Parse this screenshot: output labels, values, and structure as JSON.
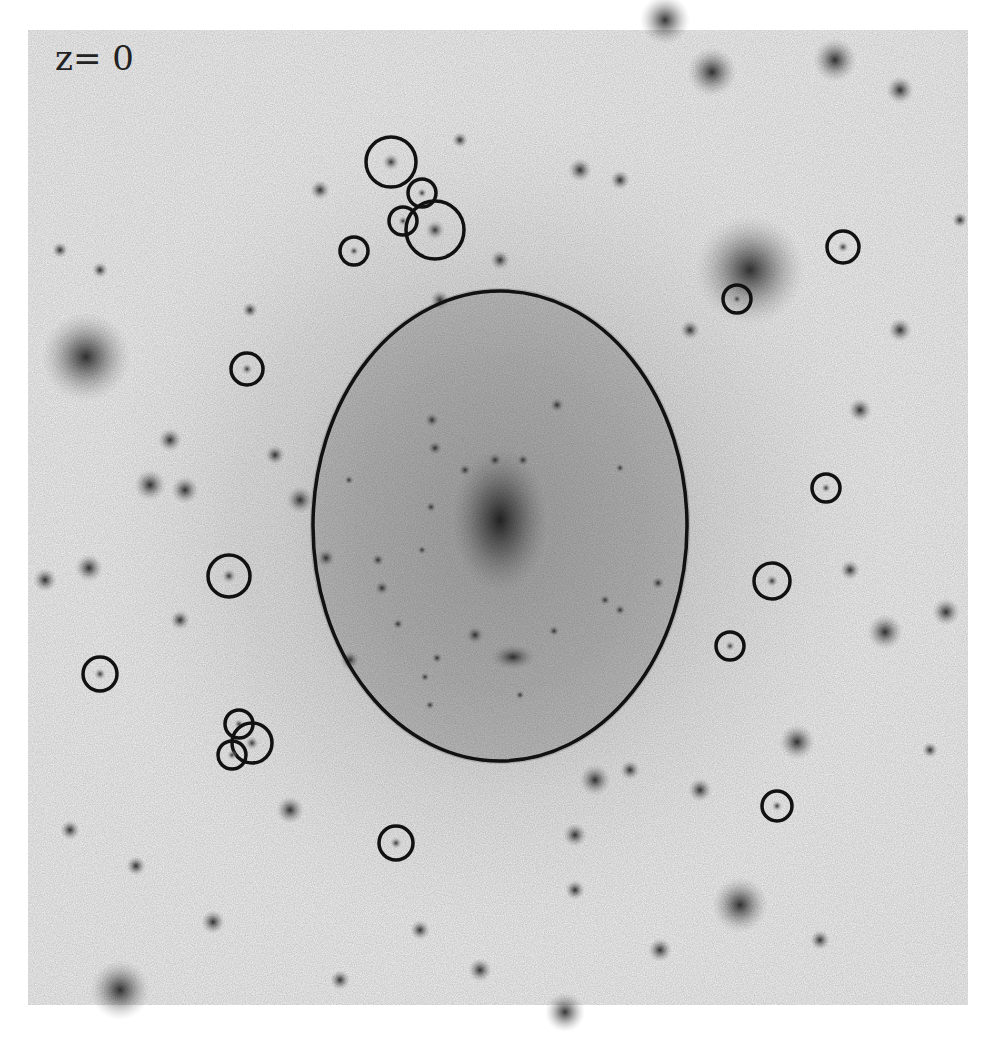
{
  "label": {
    "text": "z= 0"
  },
  "colors": {
    "background": "#ffffff",
    "marker": "#111111",
    "halo": "#9a9a9a"
  },
  "main_ellipse": {
    "cx": 500,
    "cy": 526,
    "rx": 187,
    "ry": 235
  },
  "marked_circles": [
    {
      "cx": 391,
      "cy": 162,
      "r": 25
    },
    {
      "cx": 422,
      "cy": 193,
      "r": 14
    },
    {
      "cx": 403,
      "cy": 221,
      "r": 14
    },
    {
      "cx": 435,
      "cy": 230,
      "r": 29
    },
    {
      "cx": 354,
      "cy": 251,
      "r": 14
    },
    {
      "cx": 843,
      "cy": 247,
      "r": 16
    },
    {
      "cx": 737,
      "cy": 299,
      "r": 14
    },
    {
      "cx": 247,
      "cy": 369,
      "r": 16
    },
    {
      "cx": 826,
      "cy": 488,
      "r": 14
    },
    {
      "cx": 229,
      "cy": 576,
      "r": 21
    },
    {
      "cx": 772,
      "cy": 581,
      "r": 18
    },
    {
      "cx": 730,
      "cy": 646,
      "r": 14
    },
    {
      "cx": 100,
      "cy": 674,
      "r": 17
    },
    {
      "cx": 239,
      "cy": 724,
      "r": 14
    },
    {
      "cx": 252,
      "cy": 743,
      "r": 20
    },
    {
      "cx": 232,
      "cy": 755,
      "r": 14
    },
    {
      "cx": 396,
      "cy": 843,
      "r": 17
    },
    {
      "cx": 777,
      "cy": 806,
      "r": 15
    }
  ],
  "field_sources": [
    [
      86,
      357,
      45
    ],
    [
      665,
      20,
      25
    ],
    [
      712,
      72,
      25
    ],
    [
      835,
      60,
      22
    ],
    [
      900,
      90,
      14
    ],
    [
      750,
      270,
      55
    ],
    [
      900,
      330,
      12
    ],
    [
      740,
      905,
      28
    ],
    [
      885,
      632,
      18
    ],
    [
      946,
      612,
      14
    ],
    [
      797,
      742,
      18
    ],
    [
      70,
      830,
      10
    ],
    [
      136,
      866,
      10
    ],
    [
      213,
      922,
      12
    ],
    [
      290,
      810,
      14
    ],
    [
      480,
      970,
      12
    ],
    [
      565,
      1012,
      20
    ],
    [
      575,
      890,
      10
    ],
    [
      575,
      835,
      12
    ],
    [
      595,
      780,
      16
    ],
    [
      150,
      485,
      16
    ],
    [
      185,
      490,
      14
    ],
    [
      170,
      440,
      12
    ],
    [
      89,
      568,
      14
    ],
    [
      45,
      580,
      12
    ],
    [
      300,
      500,
      14
    ],
    [
      275,
      455,
      10
    ],
    [
      180,
      620,
      10
    ],
    [
      350,
      660,
      10
    ],
    [
      700,
      790,
      12
    ],
    [
      630,
      770,
      10
    ],
    [
      850,
      570,
      10
    ],
    [
      860,
      410,
      12
    ],
    [
      580,
      170,
      12
    ],
    [
      620,
      180,
      10
    ],
    [
      500,
      260,
      10
    ],
    [
      60,
      250,
      8
    ],
    [
      100,
      270,
      8
    ],
    [
      930,
      750,
      8
    ],
    [
      960,
      220,
      8
    ],
    [
      820,
      940,
      10
    ],
    [
      660,
      950,
      12
    ],
    [
      420,
      930,
      10
    ],
    [
      340,
      980,
      10
    ],
    [
      120,
      990,
      30
    ],
    [
      320,
      190,
      10
    ],
    [
      460,
      140,
      8
    ],
    [
      440,
      300,
      10
    ],
    [
      250,
      310,
      8
    ],
    [
      690,
      330,
      10
    ]
  ],
  "inner_sources": [
    [
      500,
      520,
      60
    ],
    [
      495,
      460,
      8
    ],
    [
      465,
      470,
      7
    ],
    [
      432,
      420,
      8
    ],
    [
      435,
      448,
      8
    ],
    [
      557,
      405,
      8
    ],
    [
      523,
      460,
      7
    ],
    [
      378,
      560,
      7
    ],
    [
      382,
      588,
      8
    ],
    [
      475,
      635,
      10
    ],
    [
      513,
      657,
      18
    ],
    [
      554,
      631,
      6
    ],
    [
      605,
      600,
      6
    ],
    [
      620,
      610,
      6
    ],
    [
      658,
      583,
      7
    ],
    [
      620,
      468,
      5
    ],
    [
      431,
      507,
      6
    ],
    [
      422,
      550,
      5
    ],
    [
      437,
      658,
      6
    ],
    [
      425,
      677,
      5
    ],
    [
      430,
      705,
      5
    ],
    [
      520,
      695,
      5
    ],
    [
      326,
      558,
      10
    ],
    [
      398,
      624,
      6
    ],
    [
      349,
      480,
      5
    ]
  ]
}
